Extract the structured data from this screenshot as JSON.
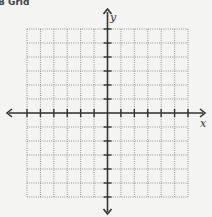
{
  "header": {
    "text": "B Grid"
  },
  "chart_data": {
    "type": "scatter",
    "title": "",
    "xlabel": "x",
    "ylabel": "y",
    "xlim": [
      -6,
      6
    ],
    "ylim": [
      -6,
      6
    ],
    "grid": true,
    "grid_style": "dotted",
    "series": [],
    "x_ticks": [
      -6,
      -5,
      -4,
      -3,
      -2,
      -1,
      0,
      1,
      2,
      3,
      4,
      5,
      6
    ],
    "y_ticks": [
      -6,
      -5,
      -4,
      -3,
      -2,
      -1,
      0,
      1,
      2,
      3,
      4,
      5,
      6
    ],
    "tick_labels": "none"
  },
  "colors": {
    "axis": "#333333",
    "grid": "#8a8a8a",
    "background": "#f4f4f2"
  }
}
